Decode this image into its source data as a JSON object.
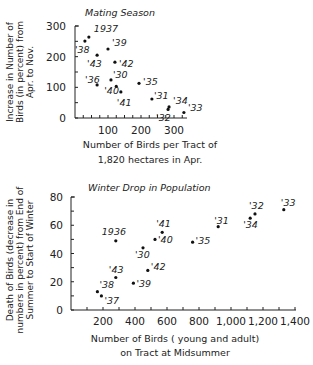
{
  "chart_data": [
    {
      "type": "scatter",
      "title": "Mating Season",
      "xlabel": [
        "Number of Birds per Tract of",
        "1,820 hectares in Apr."
      ],
      "ylabel": [
        "Increase in Number of",
        "Birds (in percent) from",
        "Apr. to Nov."
      ],
      "xlim": [
        0,
        340
      ],
      "ylim": [
        0,
        300
      ],
      "xticks": [
        100,
        200,
        300
      ],
      "xticks_minor_step": 25,
      "yticks": [
        0,
        100,
        200,
        300
      ],
      "yticks_minor_step": 50,
      "grid": false,
      "points": [
        {
          "label": "1937",
          "x": 42,
          "y": 264
        },
        {
          "label": "'38",
          "x": 30,
          "y": 251
        },
        {
          "label": "'39",
          "x": 100,
          "y": 225
        },
        {
          "label": "'43",
          "x": 67,
          "y": 205
        },
        {
          "label": "'42",
          "x": 121,
          "y": 182
        },
        {
          "label": "'30",
          "x": 109,
          "y": 124
        },
        {
          "label": "'36",
          "x": 67,
          "y": 108
        },
        {
          "label": "'40",
          "x": 125,
          "y": 103
        },
        {
          "label": "'41",
          "x": 139,
          "y": 85
        },
        {
          "label": "'35",
          "x": 194,
          "y": 113
        },
        {
          "label": "'31",
          "x": 233,
          "y": 62
        },
        {
          "label": "'34",
          "x": 285,
          "y": 36
        },
        {
          "label": "'32",
          "x": 282,
          "y": 28
        },
        {
          "label": "'33",
          "x": 330,
          "y": 18
        }
      ]
    },
    {
      "type": "scatter",
      "title": "Winter Drop in Population",
      "xlabel": [
        "Number of Birds ( young and adult)",
        "on Tract at Midsummer"
      ],
      "ylabel": [
        "Death of Birds (decrease in",
        "numbers in percent) from End of",
        "Summer to Start of Winter"
      ],
      "xlim": [
        0,
        1400
      ],
      "ylim": [
        0,
        80
      ],
      "xticks": [
        200,
        400,
        600,
        800,
        1000,
        1200,
        1400
      ],
      "xtick_labels": [
        "200",
        "400",
        "600",
        "800",
        "1,000",
        "1,200",
        "1,400"
      ],
      "xticks_minor_step": 100,
      "yticks": [
        0,
        20,
        40,
        60,
        80
      ],
      "yticks_minor_step": 10,
      "grid": false,
      "points": [
        {
          "label": "'33",
          "x": 1330,
          "y": 71
        },
        {
          "label": "'32",
          "x": 1150,
          "y": 68
        },
        {
          "label": "'34",
          "x": 1120,
          "y": 65
        },
        {
          "label": "'31",
          "x": 920,
          "y": 59
        },
        {
          "label": "'35",
          "x": 760,
          "y": 48
        },
        {
          "label": "'41",
          "x": 570,
          "y": 55
        },
        {
          "label": "'40",
          "x": 525,
          "y": 50
        },
        {
          "label": "1936",
          "x": 280,
          "y": 49
        },
        {
          "label": "'30",
          "x": 450,
          "y": 44
        },
        {
          "label": "'42",
          "x": 480,
          "y": 28
        },
        {
          "label": "'43",
          "x": 280,
          "y": 23
        },
        {
          "label": "'39",
          "x": 390,
          "y": 19
        },
        {
          "label": "'38",
          "x": 165,
          "y": 13
        },
        {
          "label": "'37",
          "x": 190,
          "y": 10
        }
      ]
    }
  ]
}
